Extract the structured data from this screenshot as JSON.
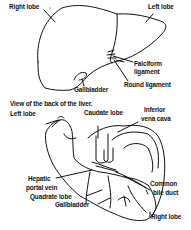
{
  "front_view": {
    "labels": {
      "right_lobe": "Right lobe",
      "left_lobe": "Left lobe",
      "falciform_ligament_line1": "Falciform",
      "falciform_ligament_line2": "ligament",
      "round_ligament": "Round ligament",
      "gallbladder": "Gallbladder"
    }
  },
  "back_view": {
    "title": "View of the back of the liver.",
    "labels": {
      "left_lobe": "Left lobe",
      "caudate_lobe": "Caudate lobe",
      "inferior_vena_cava_line1": "Inferior",
      "inferior_vena_cava_line2": "vena cava",
      "hepatic_portal_vein_line1": "Hepatic",
      "hepatic_portal_vein_line2": "portal vein",
      "common_bile_duct_line1": "Common",
      "common_bile_duct_line2": "bile duct",
      "quadrate_lobe": "Quadrate lobe",
      "gallbladder": "Gallbladder",
      "right_lobe": "Right lobe"
    }
  },
  "colors": {
    "ink": "#111111",
    "background": "#ffffff"
  }
}
